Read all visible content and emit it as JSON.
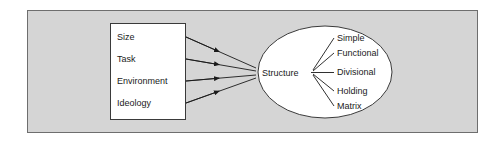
{
  "diagram": {
    "colors": {
      "page_background": "#ffffff",
      "frame_background": "#d5d5d5",
      "frame_border": "#6e6e6e",
      "node_fill": "#ffffff",
      "node_stroke": "#3a3a3a",
      "connector_stroke": "#1a1a1a",
      "text": "#1a1a1a"
    },
    "factors_box": {
      "name": "contingency-factors",
      "items": [
        {
          "label": "Size"
        },
        {
          "label": "Task"
        },
        {
          "label": "Environment"
        },
        {
          "label": "Ideology"
        }
      ]
    },
    "center_node": {
      "label": "Structure",
      "shape": "ellipse"
    },
    "structure_types": [
      {
        "label": "Simple"
      },
      {
        "label": "Functional"
      },
      {
        "label": "Divisional"
      },
      {
        "label": "Holding"
      },
      {
        "label": "Matrix"
      }
    ],
    "connectors": {
      "factor_arrows_count": 4,
      "type_branches_count": 5,
      "arrowhead": "solid-triangle"
    }
  }
}
